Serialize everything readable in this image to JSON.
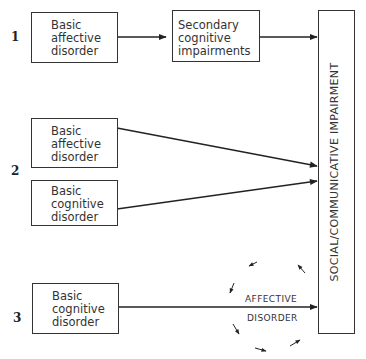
{
  "models": [
    {
      "number": "1",
      "boxes": [
        {
          "lines": [
            "Basic",
            "affective",
            "disorder"
          ]
        },
        {
          "lines": [
            "Secondary",
            "cognitive",
            "impairments"
          ]
        }
      ]
    },
    {
      "number": "2",
      "boxes": [
        {
          "lines": [
            "Basic",
            "affective",
            "disorder"
          ]
        },
        {
          "lines": [
            "Basic",
            "cognitive",
            "disorder"
          ]
        }
      ]
    },
    {
      "number": "3",
      "boxes": [
        {
          "lines": [
            "Basic",
            "cognitive",
            "disorder"
          ]
        }
      ],
      "cycle_label": [
        "AFFECTIVE",
        "DISORDER"
      ]
    }
  ],
  "outcome": {
    "label": "SOCIAL/COMMUNICATIVE IMPAIRMENT"
  }
}
